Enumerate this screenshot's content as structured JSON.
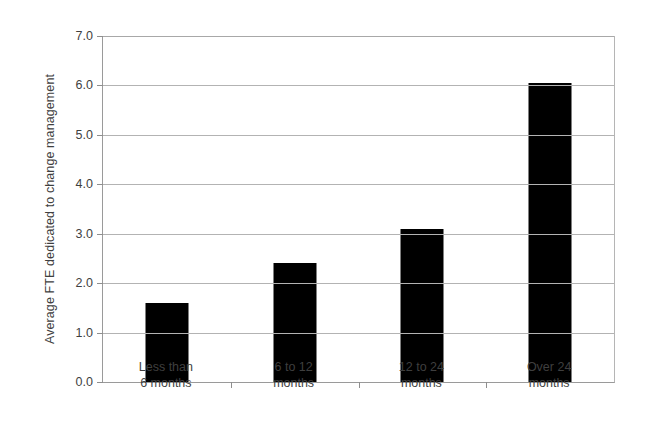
{
  "chart_data": {
    "type": "bar",
    "title": "",
    "subtitle": "",
    "xlabel": "",
    "ylabel": "Average FTE dedicated to change management",
    "categories": [
      "Less than 6 months",
      "6 to 12 months",
      "12 to 24 months",
      "Over 24 months"
    ],
    "category_lines": [
      [
        "Less than",
        "6 months"
      ],
      [
        "6 to 12",
        "months"
      ],
      [
        "12 to 24",
        "months"
      ],
      [
        "Over 24",
        "months"
      ]
    ],
    "values": [
      1.6,
      2.4,
      3.1,
      6.05
    ],
    "ylim": [
      0.0,
      7.0
    ],
    "ytick_step": 1.0,
    "yticks": [
      "0.0",
      "1.0",
      "2.0",
      "3.0",
      "4.0",
      "5.0",
      "6.0",
      "7.0"
    ],
    "grid": "horizontal",
    "legend": "none",
    "bar_color": "#000000",
    "gridline_color": "#b3b3b3",
    "axis_color": "#9a9a9a",
    "text_color": "#3f3f3f",
    "background_color": "#ffffff"
  }
}
